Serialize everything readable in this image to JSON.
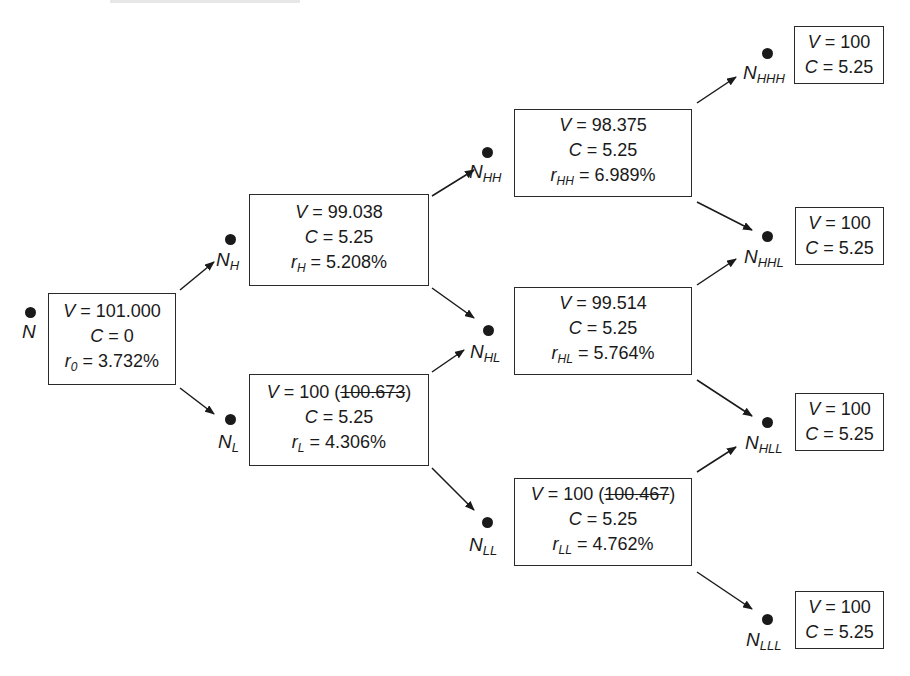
{
  "diagram": {
    "type": "binomial-interest-rate-tree",
    "nodes": {
      "N": {
        "label_main": "N",
        "label_sub": "",
        "V": "101.000",
        "V_struck": "",
        "C": "0",
        "r_sym": "r",
        "r_sub": "0",
        "r": "3.732%"
      },
      "NH": {
        "label_main": "N",
        "label_sub": "H",
        "V": "99.038",
        "V_struck": "",
        "C": "5.25",
        "r_sym": "r",
        "r_sub": "H",
        "r": "5.208%"
      },
      "NL": {
        "label_main": "N",
        "label_sub": "L",
        "V": "100",
        "V_struck": "100.673",
        "C": "5.25",
        "r_sym": "r",
        "r_sub": "L",
        "r": "4.306%"
      },
      "NHH": {
        "label_main": "N",
        "label_sub": "HH",
        "V": "98.375",
        "V_struck": "",
        "C": "5.25",
        "r_sym": "r",
        "r_sub": "HH",
        "r": "6.989%"
      },
      "NHL": {
        "label_main": "N",
        "label_sub": "HL",
        "V": "99.514",
        "V_struck": "",
        "C": "5.25",
        "r_sym": "r",
        "r_sub": "HL",
        "r": "5.764%"
      },
      "NLL": {
        "label_main": "N",
        "label_sub": "LL",
        "V": "100",
        "V_struck": "100.467",
        "C": "5.25",
        "r_sym": "r",
        "r_sub": "LL",
        "r": "4.762%"
      },
      "NHHH": {
        "label_main": "N",
        "label_sub": "HHH",
        "V": "100",
        "C": "5.25"
      },
      "NHHL": {
        "label_main": "N",
        "label_sub": "HHL",
        "V": "100",
        "C": "5.25"
      },
      "NHLL": {
        "label_main": "N",
        "label_sub": "HLL",
        "V": "100",
        "C": "5.25"
      },
      "NLLL": {
        "label_main": "N",
        "label_sub": "LLL",
        "V": "100",
        "C": "5.25"
      }
    },
    "symbols": {
      "V": "V",
      "C": "C",
      "eq": " = "
    },
    "edges": [
      [
        "N",
        "NH"
      ],
      [
        "N",
        "NL"
      ],
      [
        "NH",
        "NHH"
      ],
      [
        "NH",
        "NHL"
      ],
      [
        "NL",
        "NHL"
      ],
      [
        "NL",
        "NLL"
      ],
      [
        "NHH",
        "NHHH"
      ],
      [
        "NHH",
        "NHHL"
      ],
      [
        "NHL",
        "NHHL"
      ],
      [
        "NHL",
        "NHLL"
      ],
      [
        "NLL",
        "NHLL"
      ],
      [
        "NLL",
        "NLLL"
      ]
    ],
    "colors": {
      "ink": "#1a1a1a",
      "background": "#ffffff"
    }
  }
}
